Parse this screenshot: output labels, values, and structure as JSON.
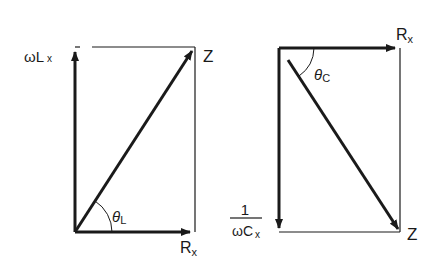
{
  "diagrams": [
    {
      "name": "inductive-impedance-diagram",
      "labels": {
        "reactance_main": "ωL",
        "reactance_sub": "x",
        "impedance": "Z",
        "resistance_main": "R",
        "resistance_sub": "x",
        "angle_main": "θ",
        "angle_sub": "L"
      }
    },
    {
      "name": "capacitive-impedance-diagram",
      "labels": {
        "resistance_main": "R",
        "resistance_sub": "x",
        "angle_main": "θ",
        "angle_sub": "C",
        "reactance_numerator": "1",
        "reactance_denominator_main": "ωC",
        "reactance_denominator_sub": "x",
        "impedance": "Z"
      }
    }
  ],
  "colors": {
    "stroke": "#1a1a1a",
    "background": "#ffffff"
  }
}
